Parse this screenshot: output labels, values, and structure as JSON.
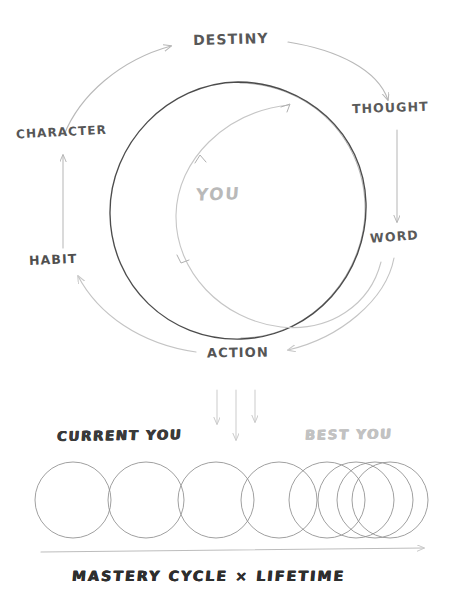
{
  "diagram": {
    "title_text_present": false,
    "cycle": {
      "center_label": "YOU",
      "nodes": [
        {
          "id": "destiny",
          "label": "DESTINY",
          "position": "top"
        },
        {
          "id": "thought",
          "label": "THOUGHT",
          "position": "upper-right"
        },
        {
          "id": "word",
          "label": "WORD",
          "position": "lower-right"
        },
        {
          "id": "action",
          "label": "ACTION",
          "position": "bottom"
        },
        {
          "id": "habit",
          "label": "HABIT",
          "position": "lower-left"
        },
        {
          "id": "character",
          "label": "CHARACTER",
          "position": "upper-left"
        }
      ],
      "flow_order": [
        "destiny",
        "thought",
        "word",
        "action",
        "habit",
        "character"
      ],
      "main_circle": {
        "cx": 238,
        "cy": 210,
        "r": 128,
        "stroke": "#3a3a3a"
      },
      "inner_spiral": {
        "stroke": "#c3c3c3",
        "arrowheads": 3,
        "direction": "counter-clockwise-inward"
      }
    },
    "progression": {
      "left_label": "CURRENT YOU",
      "right_label": "BEST YOU",
      "axis_label": "MASTERY CYCLE × LIFETIME",
      "circle_count": 8,
      "circle_radius": 38,
      "circle_centers_x": [
        73,
        146,
        216,
        279,
        327,
        356,
        375,
        390
      ],
      "circle_center_y": 500,
      "baseline_y": 553,
      "down_arrows": 3
    }
  },
  "colors": {
    "ink_dark": "#3a3a3a",
    "ink_mid": "#8c8c8c",
    "ink_light": "#c9c9c9",
    "ink_faint": "#d8d8d8",
    "paper": "#ffffff"
  }
}
